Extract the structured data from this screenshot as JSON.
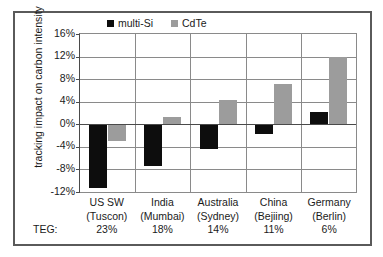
{
  "chart_data": {
    "type": "bar",
    "title": "",
    "subtitle": "",
    "xlabel": "",
    "ylabel": "tracking impact on carbon intensity",
    "ylim": [
      -12,
      16
    ],
    "ytick_values": [
      16,
      12,
      8,
      4,
      0,
      -4,
      -8,
      -12
    ],
    "ytick_labels": [
      "16%",
      "12%",
      "8%",
      "4%",
      "0%",
      "-4%",
      "-8%",
      "-12%"
    ],
    "grid": true,
    "legend_position": "top-center",
    "categories": [
      "US SW (Tuscon)",
      "India (Mumbai)",
      "Australia (Sydney)",
      "China (Bejiing)",
      "Germany (Berlin)"
    ],
    "category_lines": [
      [
        "US SW",
        "(Tuscon)",
        "23%"
      ],
      [
        "India",
        "(Mumbai)",
        "18%"
      ],
      [
        "Australia",
        "(Sydney)",
        "14%"
      ],
      [
        "China",
        "(Bejiing)",
        "11%"
      ],
      [
        "Germany",
        "(Berlin)",
        "6%"
      ]
    ],
    "row_label": "TEG:",
    "teg_values": [
      "23%",
      "18%",
      "14%",
      "11%",
      "6%"
    ],
    "series": [
      {
        "name": "multi-Si",
        "color": "#0d0d0d",
        "values": [
          -11.3,
          -7.4,
          -4.4,
          -1.7,
          2.2
        ]
      },
      {
        "name": "CdTe",
        "color": "#9c9c9c",
        "values": [
          -2.9,
          1.3,
          4.3,
          7.1,
          12.0
        ]
      }
    ]
  }
}
